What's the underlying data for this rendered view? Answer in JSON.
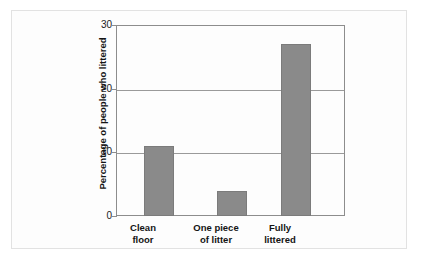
{
  "chart_data": {
    "type": "bar",
    "title": "",
    "subtitle": "",
    "xlabel": "",
    "ylabel": "Percentage of people who littered",
    "categories": [
      "Clean floor",
      "One piece of litter",
      "Fully littered"
    ],
    "category_lines": [
      [
        "Clean",
        "floor"
      ],
      [
        "One piece",
        "of litter"
      ],
      [
        "Fully",
        "littered"
      ]
    ],
    "values": [
      11,
      4,
      27
    ],
    "ylim": [
      0,
      30
    ],
    "yticks": [
      0,
      10,
      20,
      30
    ],
    "ytick_labels": [
      "0",
      "10",
      "20",
      "30"
    ],
    "grid": true,
    "grid_axis": "y",
    "legend": "none",
    "bar_color": "#8a8a8a",
    "bar_edge_color": "#7b7b7b",
    "axis_color": "#8d8d8d",
    "grid_color": "#9a9a9a",
    "text_color": "#141414",
    "background": "#fdfdfd"
  }
}
